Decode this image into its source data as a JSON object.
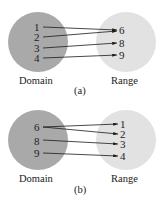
{
  "diagrams": [
    {
      "id": "a",
      "caption": "(a)",
      "domain_label": "Domain",
      "range_label": "Range",
      "domain": [
        "1",
        "2",
        "3",
        "4"
      ],
      "range": [
        "6",
        "8",
        "9"
      ],
      "mappings": [
        [
          "1",
          "6"
        ],
        [
          "2",
          "6"
        ],
        [
          "3",
          "8"
        ],
        [
          "4",
          "9"
        ]
      ]
    },
    {
      "id": "b",
      "caption": "(b)",
      "domain_label": "Domain",
      "range_label": "Range",
      "domain": [
        "6",
        "8",
        "9"
      ],
      "range": [
        "1",
        "2",
        "3",
        "4"
      ],
      "mappings": [
        [
          "6",
          "1"
        ],
        [
          "6",
          "2"
        ],
        [
          "8",
          "3"
        ],
        [
          "9",
          "4"
        ]
      ]
    }
  ],
  "colors": {
    "domain_circle": "#a9a9a9",
    "range_circle": "#e2e2e2",
    "arrow": "#1a1a1a"
  }
}
